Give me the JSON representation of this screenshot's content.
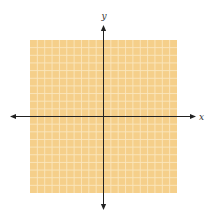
{
  "chart_data": {
    "type": "scatter",
    "title": "",
    "xlabel": "x",
    "ylabel": "y",
    "xlim": [
      -10,
      10
    ],
    "ylim": [
      -10,
      10
    ],
    "grid": true,
    "grid_step": 1,
    "grid_cells": {
      "x": 20,
      "y": 20
    },
    "points": [],
    "tick_labels": {
      "x": [],
      "y": []
    },
    "axes_arrows": true,
    "colors": {
      "grid_fill": "#f5cf8a",
      "grid_line": "#fbe7bd",
      "axis": "#222222"
    }
  }
}
